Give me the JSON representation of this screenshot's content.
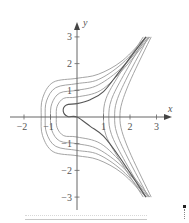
{
  "chart_data": {
    "type": "line",
    "title": "",
    "xlabel": "x",
    "ylabel": "y",
    "xlim": [
      -2.4,
      3.6
    ],
    "ylim": [
      -3.5,
      3.6
    ],
    "grid": false,
    "legend": "none",
    "x_ticks": [
      -2,
      -1,
      1,
      2,
      3
    ],
    "x_tick_labels": [
      "−2",
      "−1",
      "1",
      "2",
      "3"
    ],
    "y_ticks": [
      3,
      2,
      1,
      -1,
      -2,
      -3
    ],
    "y_tick_labels": [
      "3",
      "2",
      "1",
      "−1",
      "−2",
      "−3"
    ],
    "series": [
      {
        "name": "left-curve-1",
        "style": "light",
        "points": [
          [
            2.6,
            3
          ],
          [
            1.7,
            2.1
          ],
          [
            0.8,
            1.6
          ],
          [
            0,
            1.45
          ],
          [
            -0.9,
            1.3
          ],
          [
            -1.3,
            0.7
          ],
          [
            -1.35,
            0
          ],
          [
            -1.3,
            -0.7
          ],
          [
            -0.9,
            -1.3
          ],
          [
            0,
            -1.45
          ],
          [
            0.8,
            -1.6
          ],
          [
            1.7,
            -2.1
          ],
          [
            2.6,
            -3
          ]
        ]
      },
      {
        "name": "left-curve-2",
        "style": "light",
        "points": [
          [
            2.65,
            3
          ],
          [
            1.7,
            2.0
          ],
          [
            0.8,
            1.4
          ],
          [
            0,
            1.25
          ],
          [
            -0.8,
            1.1
          ],
          [
            -1.15,
            0.6
          ],
          [
            -1.2,
            0
          ],
          [
            -1.15,
            -0.6
          ],
          [
            -0.8,
            -1.1
          ],
          [
            0,
            -1.25
          ],
          [
            0.8,
            -1.4
          ],
          [
            1.7,
            -2.0
          ],
          [
            2.65,
            -3
          ]
        ]
      },
      {
        "name": "left-curve-3",
        "style": "light",
        "points": [
          [
            2.7,
            3
          ],
          [
            1.75,
            1.9
          ],
          [
            0.8,
            1.2
          ],
          [
            0,
            1.0
          ],
          [
            -0.65,
            0.9
          ],
          [
            -0.95,
            0.5
          ],
          [
            -1.0,
            0
          ],
          [
            -0.95,
            -0.5
          ],
          [
            -0.65,
            -0.9
          ],
          [
            0,
            -1.0
          ],
          [
            0.8,
            -1.2
          ],
          [
            1.75,
            -1.9
          ],
          [
            2.7,
            -3
          ]
        ]
      },
      {
        "name": "left-curve-4",
        "style": "light",
        "points": [
          [
            2.75,
            3
          ],
          [
            1.8,
            1.85
          ],
          [
            0.9,
            1.0
          ],
          [
            0,
            0.75
          ],
          [
            -0.5,
            0.7
          ],
          [
            -0.75,
            0.4
          ],
          [
            -0.78,
            0
          ],
          [
            -0.75,
            -0.4
          ],
          [
            -0.5,
            -0.7
          ],
          [
            0,
            -0.75
          ],
          [
            0.9,
            -1.0
          ],
          [
            1.8,
            -1.85
          ],
          [
            2.75,
            -3
          ]
        ]
      },
      {
        "name": "right-curve-1",
        "style": "light",
        "points": [
          [
            2.5,
            3
          ],
          [
            1.6,
            1.6
          ],
          [
            1.1,
            0.7
          ],
          [
            1.0,
            0
          ],
          [
            1.1,
            -0.7
          ],
          [
            1.6,
            -1.6
          ],
          [
            2.5,
            -3
          ]
        ]
      },
      {
        "name": "right-curve-2",
        "style": "light",
        "points": [
          [
            2.6,
            3
          ],
          [
            1.75,
            1.55
          ],
          [
            1.3,
            0.65
          ],
          [
            1.2,
            0
          ],
          [
            1.3,
            -0.65
          ],
          [
            1.75,
            -1.55
          ],
          [
            2.6,
            -3
          ]
        ]
      },
      {
        "name": "right-curve-3",
        "style": "light",
        "points": [
          [
            2.7,
            3
          ],
          [
            1.9,
            1.5
          ],
          [
            1.5,
            0.6
          ],
          [
            1.42,
            0
          ],
          [
            1.5,
            -0.6
          ],
          [
            1.9,
            -1.5
          ],
          [
            2.7,
            -3
          ]
        ]
      },
      {
        "name": "right-curve-4",
        "style": "light",
        "points": [
          [
            2.8,
            3
          ],
          [
            2.05,
            1.45
          ],
          [
            1.7,
            0.55
          ],
          [
            1.62,
            0
          ],
          [
            1.7,
            -0.55
          ],
          [
            2.05,
            -1.45
          ],
          [
            2.8,
            -3
          ]
        ]
      },
      {
        "name": "dark-curve",
        "style": "dark",
        "points": [
          [
            2.6,
            3
          ],
          [
            1.6,
            1.7
          ],
          [
            1.0,
            0.95
          ],
          [
            0.5,
            0.65
          ],
          [
            0,
            0.5
          ],
          [
            -0.4,
            0.45
          ],
          [
            -0.52,
            0.22
          ],
          [
            -0.35,
            0.02
          ],
          [
            0,
            0
          ],
          [
            0.5,
            -0.35
          ],
          [
            1.0,
            -0.72
          ],
          [
            1.6,
            -1.5
          ],
          [
            2.6,
            -3
          ]
        ]
      }
    ]
  }
}
